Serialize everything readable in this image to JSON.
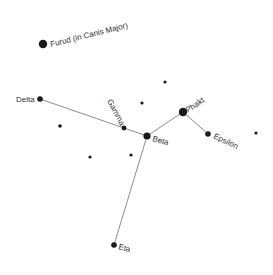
{
  "colors": {
    "star": "#1a1a1a",
    "line": "#6f6f6f",
    "label": "#333333",
    "background": "#ffffff"
  },
  "stars": [
    {
      "id": "furud",
      "label": "Furud (in Canis Major)",
      "x": 43,
      "y": 44,
      "r": 4.2,
      "labelX": 51,
      "labelY": 47,
      "angle": -14
    },
    {
      "id": "delta",
      "label": "Delta",
      "x": 40,
      "y": 99,
      "r": 2.8,
      "labelX": 16,
      "labelY": 102,
      "angle": 0
    },
    {
      "id": "gamma",
      "label": "Gamma",
      "x": 124,
      "y": 128,
      "r": 2.4,
      "labelX": 107,
      "labelY": 101,
      "angle": 62
    },
    {
      "id": "beta",
      "label": "Beta",
      "x": 147,
      "y": 136,
      "r": 3.6,
      "labelX": 152,
      "labelY": 141,
      "angle": 15
    },
    {
      "id": "phakt",
      "label": "Phakt",
      "x": 183,
      "y": 112,
      "r": 4.2,
      "labelX": 188,
      "labelY": 113,
      "angle": -35
    },
    {
      "id": "epsilon",
      "label": "Epsilon",
      "x": 208,
      "y": 134,
      "r": 2.8,
      "labelX": 213,
      "labelY": 138,
      "angle": 25
    },
    {
      "id": "eta",
      "label": "Eta",
      "x": 114,
      "y": 245,
      "r": 2.8,
      "labelX": 118,
      "labelY": 249,
      "angle": 15
    }
  ],
  "faint_stars": [
    {
      "x": 165,
      "y": 82,
      "r": 1.6
    },
    {
      "x": 142,
      "y": 103,
      "r": 1.6
    },
    {
      "x": 60,
      "y": 126,
      "r": 1.8
    },
    {
      "x": 90,
      "y": 157,
      "r": 1.6
    },
    {
      "x": 131,
      "y": 155,
      "r": 1.6
    },
    {
      "x": 256,
      "y": 133,
      "r": 1.6
    }
  ],
  "lines": [
    [
      "delta",
      "gamma"
    ],
    [
      "gamma",
      "beta"
    ],
    [
      "beta",
      "phakt"
    ],
    [
      "phakt",
      "epsilon"
    ],
    [
      "beta",
      "eta"
    ]
  ]
}
